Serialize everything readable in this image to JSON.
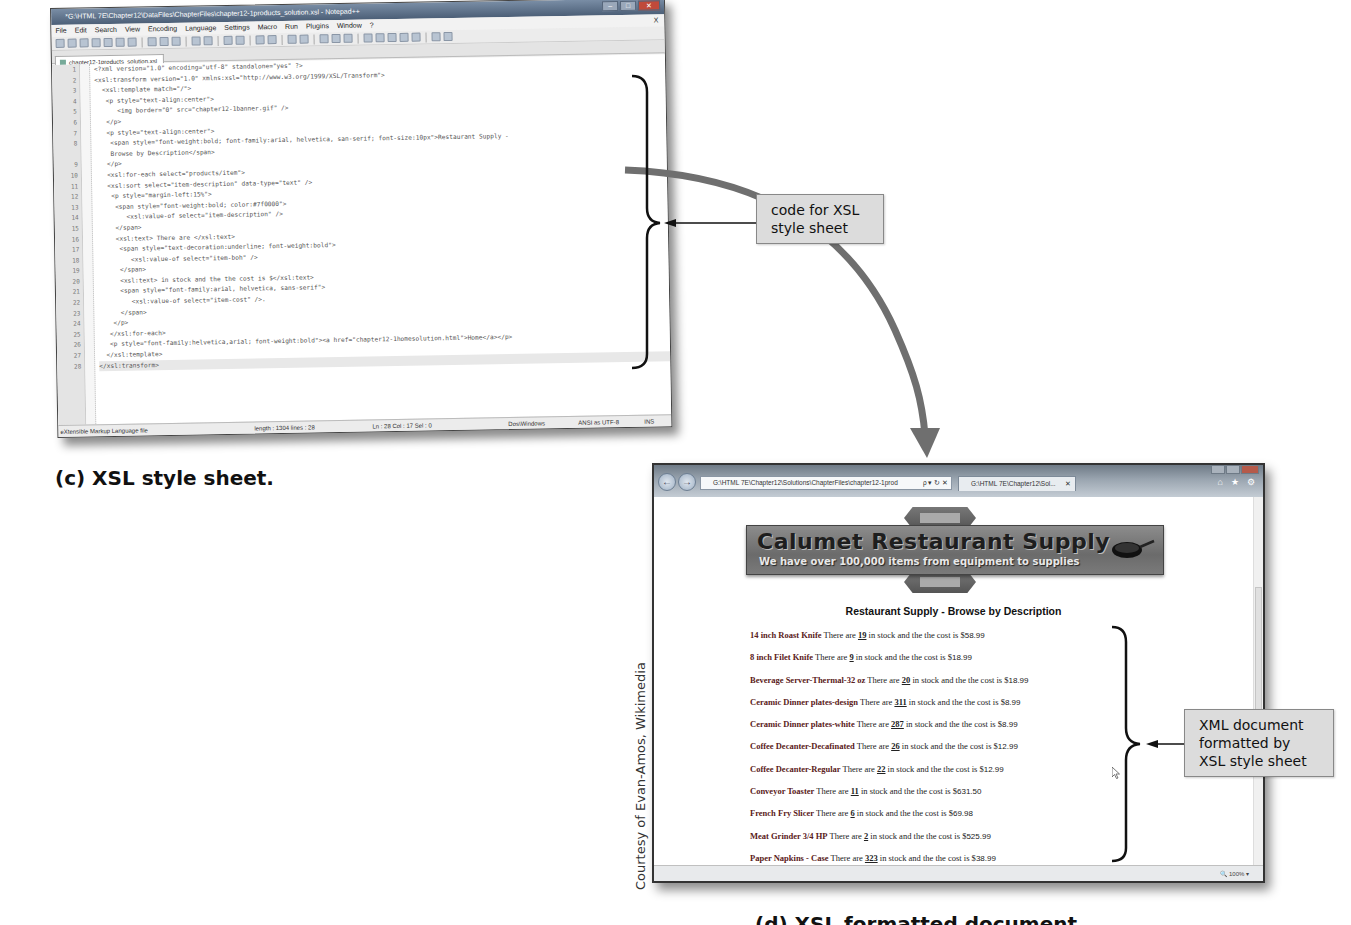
{
  "notepad": {
    "title": "*G:\\HTML 7E\\Chapter12\\DataFiles\\ChapterFiles\\chapter12-1products_solution.xsl - Notepad++",
    "menu": [
      "File",
      "Edit",
      "Search",
      "View",
      "Encoding",
      "Language",
      "Settings",
      "Macro",
      "Run",
      "Plugins",
      "Window",
      "?"
    ],
    "menu_close": "X",
    "tab_label": "chapter12-1products_solution.xsl",
    "code_lines": [
      {
        "n": "1",
        "text": "<?xml version=\"1.0\" encoding=\"utf-8\" standalone=\"yes\" ?>"
      },
      {
        "n": "2",
        "text": "<xsl:transform version=\"1.0\" xmlns:xsl=\"http://www.w3.org/1999/XSL/Transform\">"
      },
      {
        "n": "3",
        "text": "  <xsl:template match=\"/\">"
      },
      {
        "n": "4",
        "text": "   <p style=\"text-align:center\">"
      },
      {
        "n": "5",
        "text": "      <img border=\"0\" src=\"chapter12-1banner.gif\" />"
      },
      {
        "n": "6",
        "text": "   </p>"
      },
      {
        "n": "7",
        "text": "   <p style=\"text-align:center\">"
      },
      {
        "n": "8",
        "text": "    <span style=\"font-weight:bold; font-family:arial, helvetica, san-serif; font-size:10px\">Restaurant Supply -"
      },
      {
        "n": "",
        "text": "    Browse by Description</span>"
      },
      {
        "n": "9",
        "text": "   </p>"
      },
      {
        "n": "10",
        "text": "   <xsl:for-each select=\"products/item\">"
      },
      {
        "n": "11",
        "text": "   <xsl:sort select=\"item-description\" data-type=\"text\" />"
      },
      {
        "n": "12",
        "text": "    <p style=\"margin-left:15%\">"
      },
      {
        "n": "13",
        "text": "     <span style=\"font-weight:bold; color:#7f0000\">"
      },
      {
        "n": "14",
        "text": "        <xsl:value-of select=\"item-description\" />"
      },
      {
        "n": "15",
        "text": "     </span>"
      },
      {
        "n": "16",
        "text": "     <xsl:text> There are </xsl:text>"
      },
      {
        "n": "17",
        "text": "      <span style=\"text-decoration:underline; font-weight:bold\">"
      },
      {
        "n": "18",
        "text": "         <xsl:value-of select=\"item-boh\" />"
      },
      {
        "n": "19",
        "text": "      </span>"
      },
      {
        "n": "20",
        "text": "      <xsl:text> in stock and the the cost is $</xsl:text>"
      },
      {
        "n": "21",
        "text": "      <span style=\"font-family:arial, helvetica, sans-serif\">"
      },
      {
        "n": "22",
        "text": "         <xsl:value-of select=\"item-cost\" />."
      },
      {
        "n": "23",
        "text": "      </span>"
      },
      {
        "n": "24",
        "text": "    </p>"
      },
      {
        "n": "25",
        "text": "   </xsl:for-each>"
      },
      {
        "n": "26",
        "text": "   <p style=\"font-family:helvetica,arial; font-weight:bold\"><a href=\"chapter12-1homesolution.html\">Home</a></p>"
      },
      {
        "n": "27",
        "text": "  </xsl:template>"
      },
      {
        "n": "28",
        "text": "</xsl:transform>"
      }
    ],
    "status": {
      "file_type": "eXtensible Markup Language file",
      "length": "length : 1304   lines : 28",
      "position": "Ln : 28   Col : 17   Sel : 0",
      "eol": "Dos\\Windows",
      "encoding": "ANSI as UTF-8",
      "mode": "INS"
    }
  },
  "callouts": {
    "xsl_code": "code for XSL style sheet",
    "xml_formatted": "XML document formatted by XSL style sheet"
  },
  "captions": {
    "c": "(c) XSL style sheet.",
    "d": "(d) XSL formatted document."
  },
  "credit": "Courtesy of Evan-Amos, Wikimedia",
  "browser": {
    "address": "G:\\HTML 7E\\Chapter12\\Solutions\\ChapterFiles\\chapter12-1prod",
    "address_controls": "ρ ▾ ↻ ✕",
    "tab_label": "G:\\HTML 7E\\Chapter12\\Sol...",
    "tab_close": "✕",
    "tools": [
      "⌂",
      "★",
      "⚙"
    ],
    "zoom": "🔍 100%  ▾",
    "banner": {
      "title": "Calumet Restaurant Supply",
      "subtitle": "We have over 100,000 items from equipment to supplies"
    },
    "heading": "Restaurant Supply - Browse by Description",
    "items": [
      {
        "desc": "14 inch Roast Knife",
        "qty": "19",
        "cost": "58.99"
      },
      {
        "desc": "8 inch Filet Knife",
        "qty": "9",
        "cost": "18.99"
      },
      {
        "desc": "Beverage Server-Thermal-32 oz",
        "qty": "20",
        "cost": "18.99"
      },
      {
        "desc": "Ceramic Dinner plates-design",
        "qty": "311",
        "cost": "8.99"
      },
      {
        "desc": "Ceramic Dinner plates-white",
        "qty": "287",
        "cost": "8.99"
      },
      {
        "desc": "Coffee Decanter-Decafinated",
        "qty": "26",
        "cost": "12.99"
      },
      {
        "desc": "Coffee Decanter-Regular",
        "qty": "22",
        "cost": "12.99"
      },
      {
        "desc": "Conveyor Toaster",
        "qty": "11",
        "cost": "631.50"
      },
      {
        "desc": "French Fry Slicer",
        "qty": "6",
        "cost": "69.98"
      },
      {
        "desc": "Meat Grinder 3/4 HP",
        "qty": "2",
        "cost": "525.99"
      },
      {
        "desc": "Paper Napkins - Case",
        "qty": "323",
        "cost": "38.99"
      }
    ],
    "item_text": {
      "there_are": " There are ",
      "in_stock": " in stock and the the cost is $",
      "period": "."
    }
  }
}
